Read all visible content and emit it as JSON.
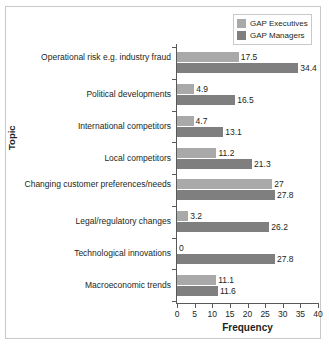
{
  "legend": {
    "items": [
      {
        "label": "GAP Executives",
        "color": "#a9a9a9"
      },
      {
        "label": "GAP Managers",
        "color": "#7f7f7f"
      }
    ]
  },
  "axes": {
    "xlabel": "Frequency",
    "ylabel": "Topic",
    "xticks": [
      "0",
      "5",
      "10",
      "15",
      "20",
      "25",
      "30",
      "35",
      "40"
    ]
  },
  "chart_data": {
    "type": "bar",
    "orientation": "horizontal",
    "title": "",
    "xlabel": "Frequency",
    "ylabel": "Topic",
    "xlim": [
      0,
      40
    ],
    "xticks": [
      0,
      5,
      10,
      15,
      20,
      25,
      30,
      35,
      40
    ],
    "grid": false,
    "legend_position": "top-right",
    "categories": [
      "Operational risk e.g. industry fraud",
      "Political developments",
      "International competitors",
      "Local competitors",
      "Changing customer preferences/needs",
      "Legal/regulatory changes",
      "Technological innovations",
      "Macroeconomic trends"
    ],
    "series": [
      {
        "name": "GAP Executives",
        "color": "#a9a9a9",
        "values": [
          17.5,
          4.9,
          4.7,
          11.2,
          27,
          3.2,
          0,
          11.1
        ]
      },
      {
        "name": "GAP Managers",
        "color": "#7f7f7f",
        "values": [
          34.4,
          16.5,
          13.1,
          21.3,
          27.8,
          26.2,
          27.8,
          11.6
        ]
      }
    ],
    "data_labels": [
      {
        "category": "Operational risk e.g. industry fraud",
        "GAP Executives": "17.5",
        "GAP Managers": "34.4"
      },
      {
        "category": "Political developments",
        "GAP Executives": "4.9",
        "GAP Managers": "16.5"
      },
      {
        "category": "International competitors",
        "GAP Executives": "4.7",
        "GAP Managers": "13.1"
      },
      {
        "category": "Local competitors",
        "GAP Executives": "11.2",
        "GAP Managers": "21.3"
      },
      {
        "category": "Changing customer preferences/needs",
        "GAP Executives": "27",
        "GAP Managers": "27.8"
      },
      {
        "category": "Legal/regulatory changes",
        "GAP Executives": "3.2",
        "GAP Managers": "26.2"
      },
      {
        "category": "Technological innovations",
        "GAP Executives": "0",
        "GAP Managers": "27.8"
      },
      {
        "category": "Macroeconomic trends",
        "GAP Executives": "11.1",
        "GAP Managers": "11.6"
      }
    ]
  }
}
